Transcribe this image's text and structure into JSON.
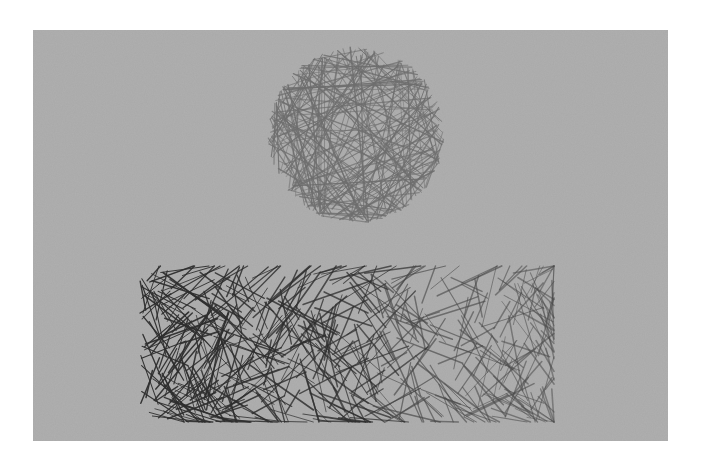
{
  "image": {
    "description": "Pencil hatching illustration on gray paper: a lightly cross-hatched circle above a densely cross-hatched horizontal rectangle",
    "background_color": "#ffffff",
    "paper_color": "#a9a9a9",
    "panel": {
      "x": 33,
      "y": 30,
      "width": 635,
      "height": 411
    }
  },
  "shapes": [
    {
      "name": "hatched-circle",
      "type": "circle",
      "cx": 356,
      "cy": 135,
      "r": 88,
      "stroke_color": "#6e6e6e",
      "stroke_density": "medium",
      "strokes": 170
    },
    {
      "name": "hatched-rectangle",
      "type": "rect",
      "x": 140,
      "y": 272,
      "width": 414,
      "height": 150,
      "stroke_color_dark": "#2e2e2e",
      "stroke_color_light": "#4a4a4a",
      "stroke_density": "heavy-left-to-light-right",
      "strokes": 520
    }
  ]
}
